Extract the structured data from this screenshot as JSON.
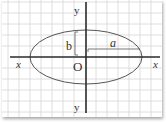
{
  "diagram": {
    "type": "ellipse-on-grid",
    "labels": {
      "y_top": "y",
      "y_bottom": "y",
      "x_left": "x",
      "x_right": "x",
      "origin": "O",
      "semi_minor": "b",
      "semi_major": "a"
    },
    "colors": {
      "grid": "#d4d4d4",
      "axis": "#2a2a2a",
      "ellipse": "#555555",
      "text": "#333333"
    }
  }
}
